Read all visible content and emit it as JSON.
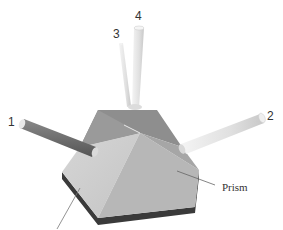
{
  "diagram": {
    "type": "3d-illustration",
    "labels": {
      "rod_1": "1",
      "rod_2": "2",
      "rod_3": "3",
      "rod_4": "4",
      "prism": "Prism"
    },
    "colors": {
      "background": "#ffffff",
      "prism_top_back": "#8e8e8e",
      "prism_top_left": "#cfcfcf",
      "prism_top_front": "#b9b9b9",
      "prism_top_right": "#a8a8a8",
      "prism_side": "#3a3a3a",
      "rod_dark": "#6f6f6f",
      "rod_light": "#e4e4e4",
      "text": "#333333",
      "leader_line": "#666666"
    }
  }
}
